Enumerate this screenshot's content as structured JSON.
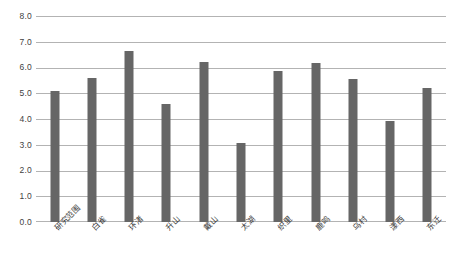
{
  "chart_data": {
    "type": "bar",
    "title": "",
    "subtitle": "",
    "xlabel": "",
    "ylabel": "",
    "ylim": [
      0.0,
      8.0
    ],
    "ytick_step": 1.0,
    "ytick_labels": [
      "0.0",
      "1.0",
      "2.0",
      "3.0",
      "4.0",
      "5.0",
      "6.0",
      "7.0",
      "8.0"
    ],
    "ytick_values": [
      0.0,
      1.0,
      2.0,
      3.0,
      4.0,
      5.0,
      6.0,
      7.0,
      8.0
    ],
    "grid": "horizontal",
    "legend": "none",
    "bar_color": "#666666",
    "gridline_color": "#b3b3b3",
    "background_color": "#ffffff",
    "xtick_rotation_deg": -45,
    "categories": [
      "研究范围",
      "白雀",
      "环渚",
      "升山",
      "戴山",
      "太湖",
      "织里",
      "鹿鸣",
      "乌村",
      "漾西",
      "东迁"
    ],
    "values": [
      5.08,
      5.6,
      6.65,
      4.6,
      6.22,
      3.05,
      5.85,
      6.17,
      5.55,
      3.93,
      5.22
    ]
  }
}
